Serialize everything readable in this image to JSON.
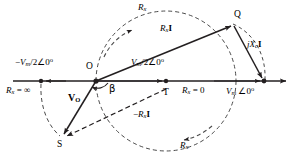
{
  "figure": {
    "type": "phasor-diagram",
    "background_color": "#ffffff",
    "line_color": "#231f20",
    "dash_color": "#4a4a4a"
  },
  "points": {
    "O": {
      "label": "O",
      "x": 96,
      "y": 81
    },
    "Q": {
      "label": "Q",
      "x": 233,
      "y": 24
    },
    "S": {
      "label": "S",
      "x": 62,
      "y": 137
    },
    "T": {
      "label": "T",
      "x": 166,
      "y": 90
    },
    "left_node": {
      "x": 41,
      "y": 81
    },
    "right_node": {
      "x": 264,
      "y": 81
    }
  },
  "axis": {
    "y": 81,
    "x_start": 13,
    "x_end": 288,
    "arrow_right": true
  },
  "labels": {
    "neg_vm_half": {
      "text": "−V_m/2∠0°",
      "x": 17,
      "y": 62
    },
    "rx_infinite": {
      "text": "R_x = ∞",
      "x": 7,
      "y": 85
    },
    "vm_half": {
      "text": "V_m/2∠0°",
      "x": 133,
      "y": 62
    },
    "rx_zero": {
      "text": "R_x = 0",
      "x": 183,
      "y": 86
    },
    "vm_zero": {
      "text": "V_m ∠0°",
      "x": 227,
      "y": 86
    },
    "rx_i": {
      "text": "R_xI",
      "x": 162,
      "y": 29
    },
    "neg_rx_i": {
      "text": "−R_xI",
      "x": 136,
      "y": 114
    },
    "jxc_i": {
      "text": "jX_cI",
      "x": 248,
      "y": 44
    },
    "vo": {
      "text": "V_O",
      "x": 72,
      "y": 98
    },
    "beta": {
      "text": "β",
      "x": 110,
      "y": 87
    },
    "rx_arc_top": {
      "text": "R_x",
      "x": 140,
      "y": 7
    },
    "rx_arc_bottom": {
      "text": "R_x",
      "x": 182,
      "y": 145
    }
  },
  "vectors": [
    {
      "name": "O-to-Q",
      "label": "R_xI",
      "from": "O",
      "to": "Q",
      "style": "solid"
    },
    {
      "name": "Q-to-right-node",
      "label": "jX_cI",
      "from": "Q",
      "to": "right_node",
      "style": "solid"
    },
    {
      "name": "O-to-S",
      "label": "V_O",
      "from": "O",
      "to": "S",
      "style": "solid"
    },
    {
      "name": "S-to-T",
      "label": "-R_xI",
      "from": "S",
      "to": "T",
      "style": "dashed"
    },
    {
      "name": "O-to-left-node",
      "label": "-V_m/2∠0°",
      "from": "O",
      "to": "left_node",
      "style": "solid"
    },
    {
      "name": "O-to-T",
      "label": "V_m/2∠0°",
      "from": "O",
      "to": "T",
      "style": "solid"
    }
  ],
  "locus": {
    "name": "semicircle-locus",
    "center_x": 166,
    "center_y": 81,
    "radius": 70,
    "style": "dashed",
    "direction_arrows": 2
  }
}
